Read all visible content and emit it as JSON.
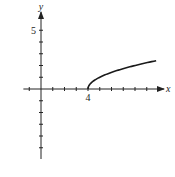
{
  "chart_data": {
    "type": "line",
    "title": "",
    "function": "y = sqrt(x - 4)",
    "xlabel": "x",
    "ylabel": "y",
    "xlim": [
      -1.5,
      10.8
    ],
    "ylim": [
      -6.1,
      6.9
    ],
    "x_tick_labels": [
      {
        "value": 4,
        "label": "4"
      }
    ],
    "y_tick_labels": [
      {
        "value": 5,
        "label": "5"
      }
    ],
    "x_ticks": [
      -1,
      1,
      2,
      3,
      4,
      5,
      6,
      7,
      8,
      9,
      10
    ],
    "y_ticks": [
      -5,
      -4,
      -3,
      -2,
      -1,
      1,
      2,
      3,
      4,
      5
    ],
    "grid": false,
    "legend": null,
    "series": [
      {
        "name": "sqrt(x-4)",
        "x": [
          4,
          4.05,
          4.2,
          4.5,
          5,
          6,
          7,
          8,
          9,
          9.8
        ],
        "y": [
          0,
          0.22,
          0.45,
          0.71,
          1,
          1.41,
          1.73,
          2,
          2.24,
          2.41
        ]
      }
    ],
    "colors": {
      "axis": "#222222",
      "curve": "#1a1a1a"
    }
  }
}
